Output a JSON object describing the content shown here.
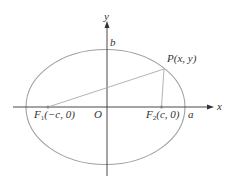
{
  "diagram": {
    "type": "ellipse-foci",
    "colors": {
      "ellipse": "#a0a0a0",
      "axes": "#333333",
      "segments": "#aaaaaa",
      "foci": "#888888",
      "text": "#333333"
    },
    "axes": {
      "x_label": "x",
      "y_label": "y",
      "origin_label": "O"
    },
    "ellipse": {
      "vertex_label": "a",
      "co_vertex_label": "b"
    },
    "foci": [
      {
        "name": "F",
        "sub": "1",
        "coords": "(−c, 0)"
      },
      {
        "name": "F",
        "sub": "2",
        "coords": "(c, 0)"
      }
    ],
    "point": {
      "label": "P(x, y)"
    }
  }
}
